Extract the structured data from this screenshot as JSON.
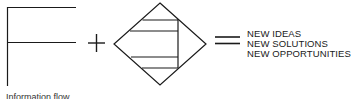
{
  "diagram": {
    "type": "equation-diagram",
    "operators": {
      "plus": "+",
      "equals": "="
    },
    "left_figure": "bracket-shape",
    "middle_figure": "diamond-with-horizontal-bands",
    "results": [
      "NEW IDEAS",
      "NEW SOLUTIONS",
      "NEW OPPORTUNITIES"
    ],
    "caption": "Information flow",
    "colors": {
      "stroke": "#1a1a1a",
      "background": "#ffffff"
    }
  }
}
